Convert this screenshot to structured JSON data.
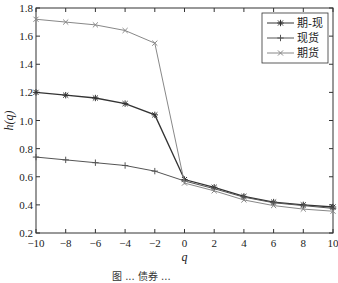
{
  "chart_data": {
    "type": "line",
    "title": "",
    "xlabel": "q",
    "ylabel": "h(q)",
    "xlim": [
      -10,
      10
    ],
    "ylim": [
      0.2,
      1.8
    ],
    "x": [
      -10,
      -8,
      -6,
      -4,
      -2,
      0,
      2,
      4,
      6,
      8,
      10
    ],
    "xticks": [
      "-10",
      "-8",
      "-6",
      "-4",
      "-2",
      "0",
      "2",
      "4",
      "6",
      "8",
      "10"
    ],
    "yticks": [
      "0.2",
      "0.4",
      "0.6",
      "0.8",
      "1.0",
      "1.2",
      "1.4",
      "1.6",
      "1.8"
    ],
    "grid": false,
    "legend_position": "upper right",
    "series": [
      {
        "name": "期-现",
        "marker": "*",
        "color": "#333333",
        "values": [
          1.2,
          1.18,
          1.16,
          1.12,
          1.04,
          0.58,
          0.525,
          0.46,
          0.42,
          0.4,
          0.385
        ]
      },
      {
        "name": "现货",
        "marker": "+",
        "color": "#555555",
        "values": [
          0.74,
          0.72,
          0.7,
          0.68,
          0.64,
          0.57,
          0.515,
          0.455,
          0.415,
          0.395,
          0.375
        ]
      },
      {
        "name": "期货",
        "marker": "x",
        "color": "#888888",
        "values": [
          1.72,
          1.7,
          1.68,
          1.64,
          1.55,
          0.555,
          0.5,
          0.435,
          0.395,
          0.37,
          0.355
        ]
      }
    ]
  },
  "caption": "图 ...  债券 ..."
}
